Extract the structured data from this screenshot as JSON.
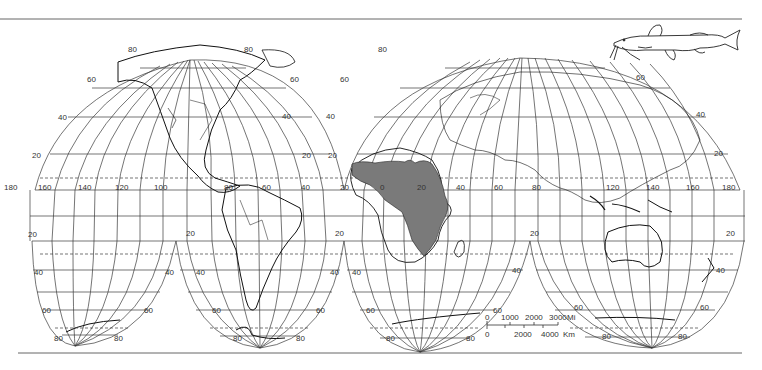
{
  "figure": {
    "projection_style": "interrupted homolosine world map",
    "shaded_region": {
      "label": "range",
      "continent": "Africa",
      "fill": "#7a7a7a"
    },
    "illustration": {
      "subject": "catfish",
      "icon": "fish-icon"
    },
    "colors": {
      "line": "#222222",
      "grid": "#3a3a3a",
      "shade": "#7a7a7a",
      "background": "#ffffff",
      "rule": "#555555"
    }
  },
  "labels": {
    "north_left": {
      "lat80": "80",
      "lat60": "60",
      "lat40": "40",
      "lat20": "20"
    },
    "north_left_right": {
      "lat80": "80",
      "lat60": "60",
      "lat40": "40",
      "lat20": "20"
    },
    "north_right_left": {
      "lat80": "80",
      "lat60": "60",
      "lat40": "40",
      "lat20": "20"
    },
    "north_right_right": {
      "lat60": "60",
      "lat40": "40",
      "lat20": "20"
    },
    "equator_longitudes": [
      "180",
      "160",
      "140",
      "120",
      "100",
      "80",
      "60",
      "40",
      "20",
      "0",
      "20",
      "40",
      "60",
      "80",
      "120",
      "140",
      "160",
      "180"
    ],
    "south_lobe1": {
      "lat20": "20",
      "lat40": "40",
      "lat60": "60",
      "lat80": "80"
    },
    "south_lobe1_right": {
      "lat40": "40",
      "lat60": "60",
      "lat80": "80"
    },
    "south_lobe2": {
      "lat20": "20",
      "lat40": "40",
      "lat60": "60",
      "lat80": "80"
    },
    "south_lobe2_right": {
      "lat40": "40",
      "lat60": "60",
      "lat80": "80"
    },
    "south_lobe3": {
      "lat20": "20",
      "lat40": "40",
      "lat60": "60",
      "lat80": "80"
    },
    "south_lobe3_right": {
      "lat20": "20",
      "lat40": "40",
      "lat60": "60",
      "lat80": "80"
    },
    "south_lobe4": {
      "lat60": "60",
      "lat80": "80"
    },
    "south_lobe4_right": {
      "lat20": "20",
      "lat40": "40",
      "lat60": "60",
      "lat80": "80"
    }
  },
  "scale_bar": {
    "miles": {
      "ticks": [
        "0",
        "1000",
        "2000",
        "3000"
      ],
      "unit": "Mi"
    },
    "km": {
      "ticks": [
        "0",
        "2000",
        "4000"
      ],
      "unit": "Km"
    }
  }
}
